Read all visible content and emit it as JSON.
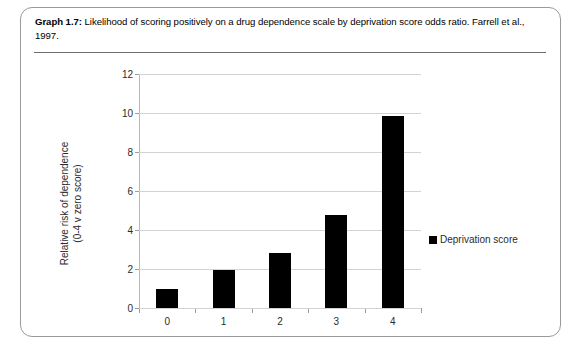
{
  "caption": {
    "label": "Graph 1.7:",
    "text": " Likelihood of scoring positively on a drug dependence scale by deprivation score odds ratio. Farrell et al., 1997."
  },
  "chart_data": {
    "type": "bar",
    "title": "",
    "categories": [
      "0",
      "1",
      "2",
      "3",
      "4"
    ],
    "values": [
      1.0,
      1.95,
      2.8,
      4.75,
      9.85
    ],
    "series": [
      {
        "name": "Deprivation score",
        "values": [
          1.0,
          1.95,
          2.8,
          4.75,
          9.85
        ],
        "color": "#000000"
      }
    ],
    "xlabel": "",
    "ylabel": "Relative risk of dependence (0-4 v zero score)",
    "ylabel_line1": "Relative risk of dependence",
    "ylabel_line2": "(0-4 v zero score)",
    "ylim": [
      0,
      12
    ],
    "yticks": [
      0,
      2,
      4,
      6,
      8,
      10,
      12
    ],
    "ytick_labels": [
      "0",
      "2",
      "4",
      "6",
      "8",
      "10",
      "12"
    ],
    "grid": true,
    "grid_axis": "y",
    "legend": {
      "position": "right",
      "entries": [
        {
          "label": "Deprivation score",
          "color": "#000000"
        }
      ]
    }
  },
  "legend_label": "Deprivation score"
}
